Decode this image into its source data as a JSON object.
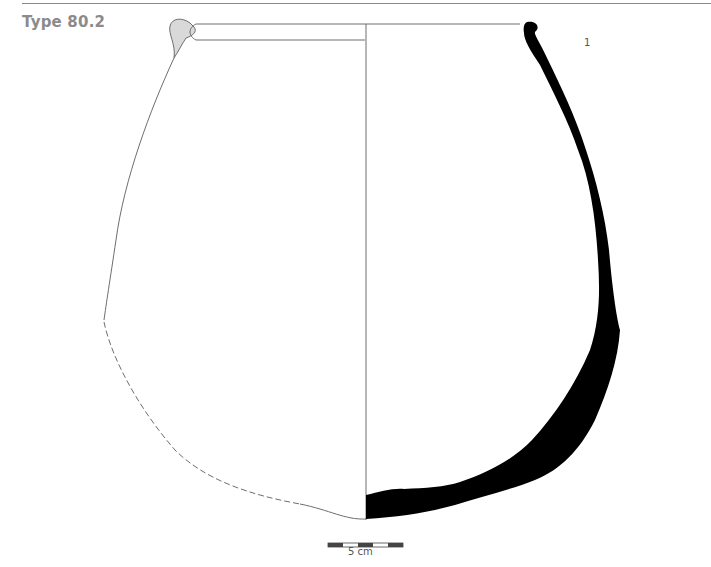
{
  "figure": {
    "title": "Type 80.2",
    "vessel_number": "1",
    "scale_bar": {
      "label": "5 cm",
      "segments": 5
    },
    "colors": {
      "section_fill": "#000000",
      "rim_fill": "#d9d9d9",
      "outline": "#6e6e6e",
      "title": "#8b8b8b"
    }
  }
}
